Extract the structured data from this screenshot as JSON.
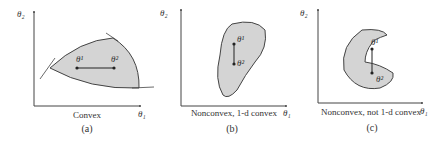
{
  "panels": [
    {
      "id": "a",
      "caption": "(a)",
      "subtitle": "Convex",
      "y_axis_label": "θ₂",
      "x_axis_label": "θ₁",
      "point1_label": "θ¹",
      "point2_label": "θ²"
    },
    {
      "id": "b",
      "caption": "(b)",
      "subtitle": "Nonconvex, 1-d convex",
      "y_axis_label": "θ₂",
      "x_axis_label": "θ₁",
      "point1_label": "θ¹",
      "point2_label": "θ²"
    },
    {
      "id": "c",
      "caption": "(c)",
      "subtitle": "Nonconvex, not 1-d convex",
      "y_axis_label": "θ₂",
      "x_axis_label": "θ₁",
      "point1_label": "θ¹",
      "point2_label": "θ²"
    }
  ],
  "colors": {
    "region_fill": "#d4d4d4",
    "stroke": "#444444"
  }
}
